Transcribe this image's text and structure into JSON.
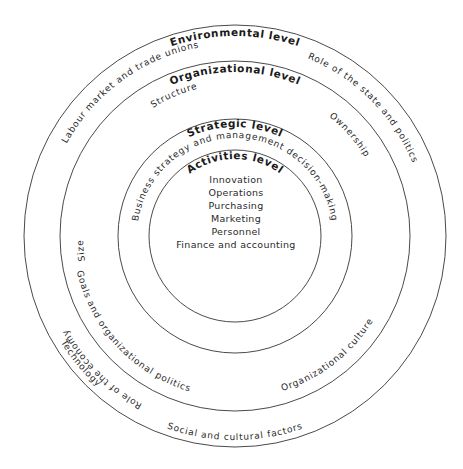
{
  "diagram": {
    "levels": {
      "environmental": "Environmental level",
      "organizational": "Organizational level",
      "strategic": "Strategic level",
      "activities": "Activities level"
    },
    "environmental_factors": {
      "labour": "Labour market and trade unions",
      "state": "Role of the state and politics",
      "technology": "Technology",
      "social": "Social and cultural factors",
      "economy": "Role of the economy"
    },
    "organizational_factors": {
      "structure": "Structure",
      "ownership": "Ownership",
      "goals": "Goals and organizational politics",
      "culture": "Organizational culture",
      "size": "Size"
    },
    "strategic_factors": {
      "decision": "Business strategy and management decision-making"
    },
    "activities": [
      "Innovation",
      "Operations",
      "Purchasing",
      "Marketing",
      "Personnel",
      "Finance and accounting"
    ],
    "colors": {
      "line": "#4a4a4a",
      "text": "#1a1a1a",
      "background": "#ffffff"
    }
  }
}
